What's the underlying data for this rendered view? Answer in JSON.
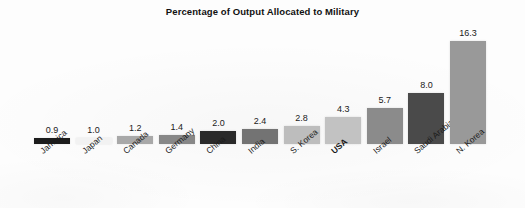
{
  "chart_data": {
    "type": "bar",
    "title": "Percentage of Output Allocated to Military",
    "xlabel": "",
    "ylabel": "",
    "ylim": [
      0,
      16.3
    ],
    "grid": false,
    "legend": "none",
    "categories": [
      "Jamaica",
      "Japan",
      "Canada",
      "Germany",
      "China",
      "India",
      "S. Korea",
      "USA",
      "Israel",
      "Saudi Arabia",
      "N. Korea"
    ],
    "values": [
      0.9,
      1.0,
      1.2,
      1.4,
      2.0,
      2.4,
      2.8,
      4.3,
      5.7,
      8.0,
      16.3
    ],
    "value_labels": [
      "0.9",
      "1.0",
      "1.2",
      "1.4",
      "2.0",
      "2.4",
      "2.8",
      "4.3",
      "5.7",
      "8.0",
      "16.3"
    ],
    "bar_colors": [
      "#1c1c1c",
      "#f2f2f2",
      "#a8a8a8",
      "#878787",
      "#2a2a2a",
      "#737373",
      "#bdbdbd",
      "#c2c2c2",
      "#8b8b8b",
      "#4a4a4a",
      "#999999"
    ],
    "emphasized_category": "USA",
    "annotations": []
  },
  "bars": [
    {
      "label": "Jamaica",
      "value_label": "0.9",
      "bold": false
    },
    {
      "label": "Japan",
      "value_label": "1.0",
      "bold": false
    },
    {
      "label": "Canada",
      "value_label": "1.2",
      "bold": false
    },
    {
      "label": "Germany",
      "value_label": "1.4",
      "bold": false
    },
    {
      "label": "China",
      "value_label": "2.0",
      "bold": false
    },
    {
      "label": "India",
      "value_label": "2.4",
      "bold": false
    },
    {
      "label": "S. Korea",
      "value_label": "2.8",
      "bold": false
    },
    {
      "label": "USA",
      "value_label": "4.3",
      "bold": true
    },
    {
      "label": "Israel",
      "value_label": "5.7",
      "bold": false
    },
    {
      "label": "Saudi Arabia",
      "value_label": "8.0",
      "bold": false
    },
    {
      "label": "N. Korea",
      "value_label": "16.3",
      "bold": false
    }
  ]
}
